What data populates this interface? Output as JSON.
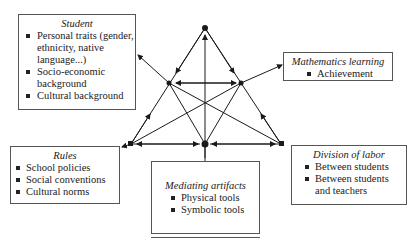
{
  "diagram": {
    "type": "activity-theory-triangle",
    "nodes": {
      "apex": [
        205,
        28
      ],
      "left_mid": [
        169,
        83
      ],
      "right_mid": [
        241,
        83
      ],
      "bottom_left": [
        131,
        144
      ],
      "bottom_center": [
        205,
        144
      ],
      "bottom_right": [
        281,
        144
      ]
    },
    "colors": {
      "line": "#1a1a1a",
      "border": "#555555"
    }
  },
  "boxes": {
    "student": {
      "title": "Student",
      "items": [
        "Personal traits (gender, ethnicity, native language...)",
        "Socio-economic background",
        "Cultural background"
      ]
    },
    "math": {
      "title": "Mathematics learning",
      "items": [
        "Achievement"
      ]
    },
    "rules": {
      "title": "Rules",
      "items": [
        "School policies",
        "Social conventions",
        "Cultural norms"
      ]
    },
    "mediating": {
      "title": "Mediating artifacts",
      "items": [
        "Physical tools",
        "Symbolic tools"
      ]
    },
    "division": {
      "title": "Division of labor",
      "items": [
        "Between students",
        "Between students and teachers"
      ]
    }
  }
}
